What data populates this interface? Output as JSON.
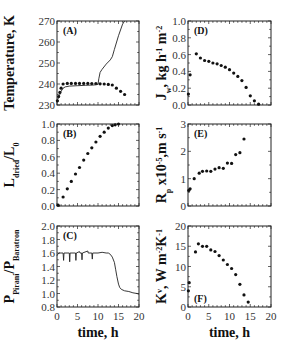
{
  "chart_data": [
    {
      "id": "A",
      "type": "scatter+line",
      "panel_label": "(A)",
      "xlabel": "",
      "ylabel": "Temperature, K",
      "xlim": [
        0,
        20
      ],
      "ylim": [
        230,
        270
      ],
      "yticks": [
        230,
        240,
        250,
        260,
        270
      ],
      "ytick_labels": [
        "230",
        "240",
        "250",
        "260",
        "270"
      ],
      "series": [
        {
          "name": "dots",
          "style": "scatter",
          "x": [
            0.1,
            0.4,
            0.7,
            1.0,
            1.5,
            2.5,
            3.5,
            4.5,
            5.5,
            6.5,
            7.5,
            8.5,
            9.5,
            10.5,
            11.5,
            12.5,
            13.5,
            14.5,
            15.5,
            16.5
          ],
          "y": [
            232,
            234,
            236,
            238,
            240,
            240.3,
            240.3,
            240.3,
            240.3,
            240.3,
            240.3,
            240.2,
            240.2,
            240.1,
            240.0,
            239.8,
            239.5,
            238.0,
            236.5,
            235.0
          ]
        },
        {
          "name": "line",
          "style": "line",
          "x": [
            0,
            0.5,
            1.0,
            1.5,
            2.0,
            3.0,
            5.0,
            7.0,
            9.0,
            10.0,
            10.2,
            10.5,
            11.0,
            12.0,
            13.0,
            13.5,
            14.0,
            15.0,
            16.0,
            16.5
          ],
          "y": [
            232,
            234,
            236.5,
            238,
            238.6,
            239.0,
            239.2,
            239.4,
            239.5,
            239.8,
            242.5,
            245.5,
            247.0,
            249.5,
            251.5,
            253.0,
            256.5,
            263.0,
            268.5,
            270.0
          ]
        }
      ]
    },
    {
      "id": "B",
      "type": "scatter",
      "panel_label": "(B)",
      "xlabel": "",
      "ylabel": "L_dried/L_0",
      "ylabel_parts": {
        "main1": "L",
        "sub1": "dried",
        "main2": "/L",
        "sub2": "0"
      },
      "xlim": [
        0,
        20
      ],
      "ylim": [
        0.0,
        1.0
      ],
      "yticks": [
        0.0,
        0.2,
        0.4,
        0.6,
        0.8,
        1.0
      ],
      "ytick_labels": [
        "0.0",
        "0.2",
        "0.4",
        "0.6",
        "0.8",
        "1.0"
      ],
      "series": [
        {
          "name": "dots",
          "x": [
            0.3,
            1.5,
            2.5,
            3.5,
            4.5,
            5.5,
            6.5,
            7.5,
            8.5,
            9.5,
            10.5,
            11.5,
            12.5,
            13.5,
            14.2,
            15.0
          ],
          "y": [
            0.01,
            0.11,
            0.21,
            0.3,
            0.39,
            0.47,
            0.56,
            0.64,
            0.71,
            0.78,
            0.85,
            0.9,
            0.95,
            0.98,
            0.99,
            1.0
          ]
        }
      ]
    },
    {
      "id": "C",
      "type": "line",
      "panel_label": "(C)",
      "xlabel": "time, h",
      "ylabel": "P_Pirani/P_Baratron",
      "ylabel_parts": {
        "main1": "P",
        "sub1": "Pirani",
        "main2": "/P",
        "sub2": "Baratron"
      },
      "xlim": [
        0,
        20
      ],
      "ylim": [
        0.8,
        2.0
      ],
      "xticks": [
        0,
        5,
        10,
        15,
        20
      ],
      "xtick_labels": [
        "0",
        "5",
        "10",
        "15",
        "20"
      ],
      "yticks": [
        0.8,
        1.0,
        1.2,
        1.4,
        1.6,
        1.8,
        2.0
      ],
      "ytick_labels": [
        "0.8",
        "1.0",
        "1.2",
        "1.4",
        "1.6",
        "1.8",
        "2.0"
      ],
      "series": [
        {
          "name": "ratio",
          "x": [
            0,
            0.2,
            0.5,
            1.5,
            1.6,
            1.7,
            3.0,
            3.1,
            3.2,
            4.5,
            4.6,
            4.7,
            5.5,
            5.6,
            6.0,
            6.1,
            6.2,
            7.5,
            7.6,
            8.5,
            8.6,
            8.7,
            10.0,
            11.0,
            12.0,
            12.5,
            13.0,
            13.5,
            14.0,
            14.3,
            14.6,
            15.0,
            15.3,
            15.7,
            16.5,
            17.5,
            18.5,
            19.5,
            20.0
          ],
          "y": [
            1.56,
            1.58,
            1.6,
            1.6,
            1.49,
            1.6,
            1.6,
            1.47,
            1.6,
            1.6,
            1.49,
            1.6,
            1.62,
            1.6,
            1.6,
            1.5,
            1.6,
            1.63,
            1.6,
            1.6,
            1.51,
            1.6,
            1.6,
            1.61,
            1.6,
            1.6,
            1.58,
            1.54,
            1.46,
            1.36,
            1.25,
            1.14,
            1.09,
            1.06,
            1.04,
            1.03,
            1.01,
            1.0,
            0.99
          ]
        }
      ]
    },
    {
      "id": "D",
      "type": "scatter",
      "panel_label": "(D)",
      "xlabel": "",
      "ylabel": "J_w, kg h^-1 m^-2",
      "ylabel_parts": {
        "main1": "J",
        "sub1": "w",
        "rest": ", kg h",
        "sup1": "-1",
        "rest2": " m",
        "sup2": "-2"
      },
      "xlim": [
        0,
        20
      ],
      "ylim": [
        0.0,
        1.0
      ],
      "yticks": [
        0.0,
        0.2,
        0.4,
        0.6,
        0.8,
        1.0
      ],
      "ytick_labels": [
        "0.0",
        "0.2",
        "0.4",
        "0.6",
        "0.8",
        "1.0"
      ],
      "series": [
        {
          "name": "dots",
          "x": [
            0.1,
            0.5,
            2.0,
            3.0,
            4.0,
            5.0,
            6.0,
            7.0,
            8.0,
            9.0,
            10.0,
            11.0,
            12.0,
            13.0,
            14.0,
            15.0,
            16.0,
            17.0
          ],
          "y": [
            0.13,
            0.36,
            0.61,
            0.56,
            0.53,
            0.52,
            0.5,
            0.49,
            0.47,
            0.45,
            0.42,
            0.38,
            0.34,
            0.29,
            0.21,
            0.11,
            0.05,
            0.01
          ]
        }
      ]
    },
    {
      "id": "E",
      "type": "scatter",
      "panel_label": "(E)",
      "xlabel": "",
      "ylabel": "R_p x10^-5, m s^-1",
      "ylabel_parts": {
        "main1": "R",
        "sub1": "p",
        "rest": " x10",
        "sup1": "-5",
        "rest2": ",m s",
        "sup2": "-1"
      },
      "xlim": [
        0,
        20
      ],
      "ylim": [
        0,
        3
      ],
      "yticks": [
        0,
        1,
        2,
        3
      ],
      "ytick_labels": [
        "0",
        "1",
        "2",
        "3"
      ],
      "series": [
        {
          "name": "dots",
          "x": [
            0.2,
            0.5,
            1.5,
            2.7,
            3.5,
            4.5,
            5.5,
            6.5,
            7.5,
            8.5,
            9.5,
            10.5,
            11.5,
            12.5,
            13.5
          ],
          "y": [
            0.57,
            0.63,
            1.0,
            1.2,
            1.27,
            1.28,
            1.27,
            1.35,
            1.4,
            1.38,
            1.57,
            1.56,
            1.88,
            1.95,
            2.45
          ]
        }
      ]
    },
    {
      "id": "F",
      "type": "scatter",
      "panel_label": "(F)",
      "xlabel": "time, h",
      "ylabel": "K^v, W m^-2 K^-1",
      "ylabel_parts": {
        "main1": "K",
        "sup0": "v",
        "rest": ", W m",
        "sup1": "-2",
        "rest2": "K",
        "sup2": "-1"
      },
      "xlim": [
        0,
        20
      ],
      "ylim": [
        0,
        20
      ],
      "xticks": [
        0,
        5,
        10,
        15,
        20
      ],
      "xtick_labels": [
        "0",
        "5",
        "10",
        "15",
        "20"
      ],
      "yticks": [
        0,
        5,
        10,
        15,
        20
      ],
      "ytick_labels": [
        "0",
        "5",
        "10",
        "15",
        "20"
      ],
      "series": [
        {
          "name": "dots",
          "x": [
            0.1,
            0.3,
            1.8,
            2.5,
            3.5,
            4.5,
            5.5,
            6.5,
            7.5,
            8.5,
            9.5,
            10.5,
            11.5,
            12.5,
            13.5,
            14.5
          ],
          "y": [
            4.0,
            6.0,
            13.6,
            15.6,
            15.0,
            15.0,
            14.1,
            13.7,
            12.7,
            11.6,
            10.5,
            9.5,
            8.0,
            5.6,
            3.0,
            1.2
          ]
        }
      ]
    }
  ]
}
